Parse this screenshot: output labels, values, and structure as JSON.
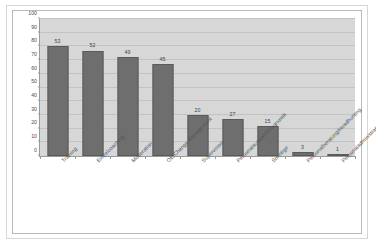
{
  "chart_data": {
    "type": "bar",
    "title": "",
    "subtitle": "",
    "xlabel": "",
    "ylabel": "",
    "ylim": [
      0,
      100
    ],
    "yticks": [
      0,
      10,
      20,
      30,
      40,
      50,
      60,
      70,
      80,
      90,
      100
    ],
    "ytick_labels": [
      "0",
      "10",
      "20",
      "30",
      "40",
      "50",
      "60",
      "70",
      "80",
      "90",
      "100"
    ],
    "grid": true,
    "legend": false,
    "legend_position": "none",
    "categories": [
      "Training",
      "Einzelcoaching",
      "Moderation",
      "OE/Change-Management",
      "Supervision",
      "Personalauswahl/Diagnostik",
      "Sonstige",
      "Personalberatung/Headhunting",
      "Personaladministration"
    ],
    "values": [
      80,
      77,
      72,
      67,
      30,
      27,
      22,
      3,
      1
    ],
    "data_labels": [
      "53",
      "52",
      "49",
      "45",
      "20",
      "27",
      "15",
      "3",
      "1"
    ],
    "colors": {
      "bar_fill": "#6e6e6e",
      "bar_edge": "#5a5a5a",
      "plot_background": "#d7d7d7",
      "gridline": "#c2c2c2",
      "axis_line": "#9a9a9a",
      "tick_text": "#4d4d4d",
      "label_text": "#555555",
      "figure_background": "#ffffff",
      "figure_border": "#d6d6d6",
      "chart_border": "#b9b9b9"
    }
  }
}
